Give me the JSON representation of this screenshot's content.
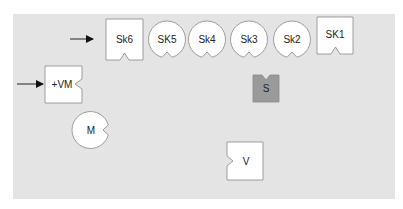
{
  "diagram": {
    "background_color": "#e4e4e4",
    "shape_fill": "#ffffff",
    "shape_stroke": "#888888",
    "highlight_fill": "#9a9a9a",
    "row_top": {
      "items": [
        {
          "id": "sk6",
          "label": "Sk6",
          "shape": "square",
          "notch": "bottom"
        },
        {
          "id": "sk5",
          "label": "SK5",
          "shape": "circle",
          "notch": "bottom"
        },
        {
          "id": "sk4",
          "label": "Sk4",
          "shape": "circle",
          "notch": "bottom"
        },
        {
          "id": "sk3",
          "label": "Sk3",
          "shape": "circle",
          "notch": "bottom"
        },
        {
          "id": "sk2",
          "label": "Sk2",
          "shape": "circle",
          "notch": "bottom"
        },
        {
          "id": "sk1",
          "label": "SK1",
          "shape": "square",
          "notch": "bottom"
        }
      ]
    },
    "vm": {
      "label": "+VM",
      "shape": "square",
      "notch": "right"
    },
    "m": {
      "label": "M",
      "shape": "circle",
      "notch": "right"
    },
    "s": {
      "label": "S",
      "shape": "square",
      "notch": "top",
      "fill": "#9a9a9a"
    },
    "v": {
      "label": "V",
      "shape": "square",
      "notch": "left"
    },
    "arrows": [
      {
        "id": "arrow-to-sk6",
        "direction": "right"
      },
      {
        "id": "arrow-to-vm",
        "direction": "right"
      }
    ]
  }
}
